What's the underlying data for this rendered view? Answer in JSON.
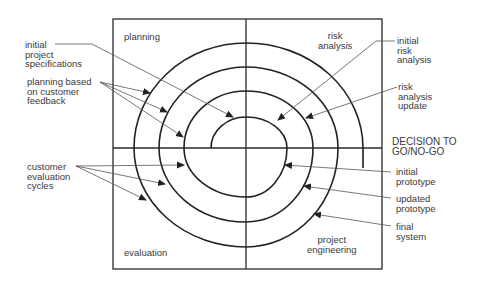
{
  "diagram": {
    "type": "spiral-model",
    "quadrants": {
      "top_left": "planning",
      "top_right": "risk\nanalysis",
      "bottom_left": "evaluation",
      "bottom_right": "project\nengineering"
    },
    "axis_label": "DECISION TO\nGO/NO-GO",
    "callouts_left": {
      "initial_project_specifications": "initial\nproject\nspecifications",
      "planning_based_on_customer_feedback": "planning based\non customer\nfeedback",
      "customer_evaluation_cycles": "customer\nevaluation\ncycles"
    },
    "callouts_right": {
      "initial_risk_analysis": "initial\nrisk\nanalysis",
      "risk_analysis_update": "risk\nanalysis\nupdate",
      "initial_prototype": "initial\nprototype",
      "updated_prototype": "updated\nprototype",
      "final_system": "final\nsystem"
    },
    "colors": {
      "line": "#2a2a2a",
      "leader": "#555555",
      "text": "#3a3a3a"
    }
  }
}
